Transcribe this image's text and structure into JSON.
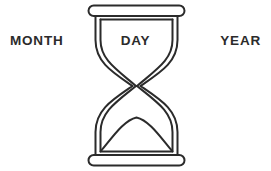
{
  "figure": {
    "name": "hourglass-date-diagram",
    "background_color": "#ffffff",
    "stroke_color": "#2b2b2b"
  },
  "labels": {
    "month": "MONTH",
    "day": "DAY",
    "year": "YEAR"
  },
  "icon": {
    "name": "hourglass-icon",
    "description": "hourglass"
  }
}
